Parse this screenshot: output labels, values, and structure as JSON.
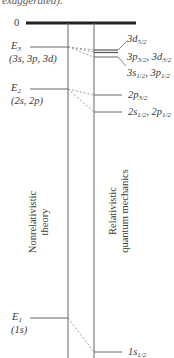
{
  "caption": "exaggerated).",
  "zero_label": "0",
  "nonrelativistic": {
    "title_line1": "Nonrelativistic",
    "title_line2": "theory",
    "levels": [
      {
        "name": "E3",
        "symbol": "E",
        "sub": "3",
        "states": "(3s, 3p, 3d)"
      },
      {
        "name": "E2",
        "symbol": "E",
        "sub": "2",
        "states": "(2s, 2p)"
      },
      {
        "name": "E1",
        "symbol": "E",
        "sub": "1",
        "states": "(1s)"
      }
    ]
  },
  "relativistic": {
    "title_line1": "Relativistic",
    "title_line2": "quantum mechanics",
    "levels": [
      {
        "label": "3d",
        "sub": "5/2"
      },
      {
        "label_a": "3p",
        "sub_a": "3/2",
        "label_b": "3d",
        "sub_b": "3/2"
      },
      {
        "label_a": "3s",
        "sub_a": "1/2",
        "label_b": "3p",
        "sub_b": "1/2"
      },
      {
        "label": "2p",
        "sub": "3/2"
      },
      {
        "label_a": "2s",
        "sub_a": "1/2",
        "label_b": "2p",
        "sub_b": "1/2"
      },
      {
        "label": "1s",
        "sub": "1/2"
      }
    ]
  },
  "colors": {
    "line": "#555555",
    "thick_line": "#222222",
    "dash": "#777777"
  }
}
